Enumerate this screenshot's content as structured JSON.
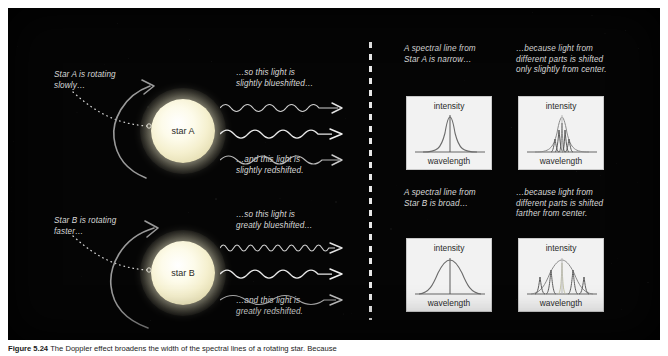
{
  "figure": {
    "caption_prefix": "Figure 5.24",
    "caption_text": "The Doppler effect broadens the width of the spectral lines of a rotating star. Because"
  },
  "left_panel": {
    "star_a": {
      "label": "star A",
      "rotation_note": "Star A is rotating\nslowly…",
      "blueshift_note": "…so this light is\nslightly blueshifted…",
      "redshift_note": "…and this light is\nslightly redshifted."
    },
    "star_b": {
      "label": "star B",
      "rotation_note": "Star B is rotating\nfaster…",
      "blueshift_note": "…so this light is\ngreatly blueshifted…",
      "redshift_note": "…and this light is\ngreatly redshifted."
    }
  },
  "right_panel": {
    "row_a": {
      "note_left": "A spectral line from\nStar A is narrow…",
      "note_right": "…because light from\ndifferent parts is shifted\nonly slightly from center."
    },
    "row_b": {
      "note_left": "A spectral line from\nStar B is broad…",
      "note_right": "…because light from\ndifferent parts is shifted\nfarther from center."
    }
  },
  "graphs": {
    "y_axis_label": "intensity",
    "x_axis_label": "wavelength",
    "narrow_single": {
      "title": "Narrow spectral line from Star A",
      "peak_width": "narrow",
      "component_count": 1
    },
    "narrow_components": {
      "title": "Narrow line built from slightly shifted components",
      "peak_width": "narrow",
      "component_count": 5,
      "component_spread": "small"
    },
    "broad_single": {
      "title": "Broad spectral line from Star B",
      "peak_width": "broad",
      "component_count": 1
    },
    "broad_components": {
      "title": "Broad line built from widely shifted components",
      "peak_width": "broad",
      "component_count": 5,
      "component_spread": "large"
    }
  },
  "colors": {
    "background": "#050505",
    "page": "#ffffff",
    "note_text": "#d8d8d8",
    "graph_panel": "#f2f2f2",
    "graph_ink": "#555555",
    "star_core": "#ffffff",
    "divider": "#e8e8e8"
  }
}
